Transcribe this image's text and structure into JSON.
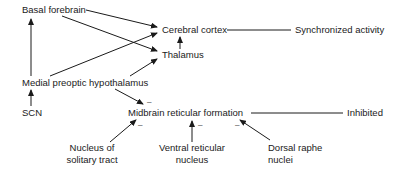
{
  "diagram": {
    "nodes": {
      "basal_forebrain": "Basal forebrain",
      "cerebral_cortex": "Cerebral cortex",
      "synchronized_activity": "Synchronized activity",
      "thalamus": "Thalamus",
      "medial_preoptic_hypothalamus": "Medial preoptic hypothalamus",
      "scn": "SCN",
      "midbrain_reticular_formation": "Midbrain reticular formation",
      "inhibited": "Inhibited",
      "nucleus_solitary_tract_line1": "Nucleus of",
      "nucleus_solitary_tract_line2": "solitary tract",
      "ventral_reticular_nucleus_line1": "Ventral reticular",
      "ventral_reticular_nucleus_line2": "nucleus",
      "dorsal_raphe_nuclei_line1": "Dorsal raphe",
      "dorsal_raphe_nuclei_line2": "nuclei"
    },
    "inhibitory_sign": "–",
    "edges": [
      {
        "from": "Basal forebrain",
        "to": "Cerebral cortex",
        "type": "arrow"
      },
      {
        "from": "Basal forebrain",
        "to": "Thalamus",
        "type": "arrow"
      },
      {
        "from": "Medial preoptic hypothalamus",
        "to": "Basal forebrain",
        "type": "arrow"
      },
      {
        "from": "Medial preoptic hypothalamus",
        "to": "Cerebral cortex",
        "type": "arrow"
      },
      {
        "from": "Medial preoptic hypothalamus",
        "to": "Thalamus",
        "type": "arrow"
      },
      {
        "from": "Thalamus",
        "to": "Cerebral cortex",
        "type": "arrow"
      },
      {
        "from": "Cerebral cortex",
        "to": "Synchronized activity",
        "type": "line"
      },
      {
        "from": "SCN",
        "to": "Medial preoptic hypothalamus",
        "type": "arrow"
      },
      {
        "from": "Medial preoptic hypothalamus",
        "to": "Midbrain reticular formation",
        "type": "inhibitory"
      },
      {
        "from": "Nucleus of solitary tract",
        "to": "Midbrain reticular formation",
        "type": "inhibitory"
      },
      {
        "from": "Ventral reticular nucleus",
        "to": "Midbrain reticular formation",
        "type": "inhibitory"
      },
      {
        "from": "Dorsal raphe nuclei",
        "to": "Midbrain reticular formation",
        "type": "inhibitory"
      },
      {
        "from": "Midbrain reticular formation",
        "to": "Inhibited",
        "type": "line"
      }
    ]
  }
}
